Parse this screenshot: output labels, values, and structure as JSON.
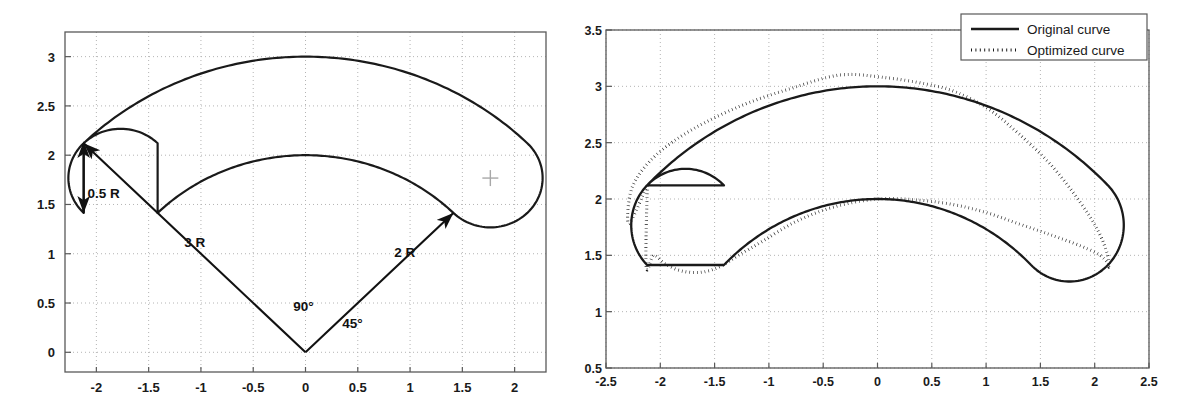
{
  "figure": {
    "background_color": "#ffffff",
    "axis_color": "#595959",
    "grid_color": "#b4b4b4",
    "curve_color": "#1a1a1a",
    "annotation_color": "#111111"
  },
  "chart_data": [
    {
      "id": "left-panel",
      "type": "line",
      "title": "",
      "xlabel": "",
      "ylabel": "",
      "xlim": [
        -2.3,
        2.3
      ],
      "ylim": [
        -0.2,
        3.25
      ],
      "xticks": [
        -2,
        -1.5,
        -1,
        -0.5,
        0,
        0.5,
        1,
        1.5,
        2
      ],
      "xtick_labels": [
        "-2",
        "-1.5",
        "-1",
        "-0.5",
        "0",
        "0.5",
        "1",
        "1.5",
        "2"
      ],
      "yticks": [
        0,
        0.5,
        1,
        1.5,
        2,
        2.5,
        3
      ],
      "ytick_labels": [
        "0",
        "0.5",
        "1",
        "1.5",
        "2",
        "2.5",
        "3"
      ],
      "grid": true,
      "legend": null,
      "geometry": {
        "description": "Closed curvilinear slot: outer arc radius 3, inner arc radius 2, joined by semicircular end caps of radius 0.5, centered on origin, spanning 45deg to 135deg",
        "origin": [
          0,
          0
        ],
        "outer_radius": 3,
        "inner_radius": 2,
        "cap_radius": 0.5,
        "start_angle_deg": 45,
        "end_angle_deg": 135,
        "cap_center_left": [
          -1.7678,
          1.7678
        ],
        "cap_center_right": [
          1.7678,
          1.7678
        ]
      },
      "series": [
        {
          "name": "Original curve",
          "style": "solid",
          "outer_arc_radius": 3,
          "inner_arc_radius": 2
        }
      ],
      "annotations": [
        {
          "id": "radius-3",
          "text": "3 R",
          "x": -1.06,
          "y": 1.07,
          "arrow_from": [
            0,
            0
          ],
          "arrow_to": [
            -2.1213,
            2.1213
          ],
          "arrow_heads": "end"
        },
        {
          "id": "radius-2",
          "text": "2 R",
          "x": 0.95,
          "y": 0.97,
          "arrow_from": [
            0,
            0
          ],
          "arrow_to": [
            1.4142,
            1.4142
          ],
          "arrow_heads": "end"
        },
        {
          "id": "cap-radius",
          "text": "0.5 R",
          "x": -1.93,
          "y": 1.57,
          "arrow_from": [
            -2.1213,
            2.1213
          ],
          "arrow_to": [
            -2.1213,
            1.4142
          ],
          "arrow_heads": "both"
        },
        {
          "id": "angle-90",
          "text": "90°",
          "x": -0.02,
          "y": 0.42
        },
        {
          "id": "angle-45",
          "text": "45°",
          "x": 0.45,
          "y": 0.25
        },
        {
          "id": "center-marker",
          "text": "+",
          "x": 1.7678,
          "y": 1.7678
        }
      ]
    },
    {
      "id": "right-panel",
      "type": "line",
      "title": "",
      "xlabel": "",
      "ylabel": "",
      "xlim": [
        -2.5,
        2.5
      ],
      "ylim": [
        0.5,
        3.5
      ],
      "xticks": [
        -2.5,
        -2,
        -1.5,
        -1,
        -0.5,
        0,
        0.5,
        1,
        1.5,
        2,
        2.5
      ],
      "xtick_labels": [
        "-2.5",
        "-2",
        "-1.5",
        "-1",
        "-0.5",
        "0",
        "0.5",
        "1",
        "1.5",
        "2",
        "2.5"
      ],
      "yticks": [
        0.5,
        1,
        1.5,
        2,
        2.5,
        3,
        3.5
      ],
      "ytick_labels": [
        "0.5",
        "1",
        "1.5",
        "2",
        "2.5",
        "3",
        "3.5"
      ],
      "grid": true,
      "legend": {
        "position": "top-right",
        "entries": [
          {
            "label": "Original curve",
            "style": "solid"
          },
          {
            "label": "Optimized curve",
            "style": "dotted"
          }
        ]
      },
      "series": [
        {
          "name": "Original curve",
          "style": "solid",
          "comment": "same closed slot as left panel: outer R=3, inner R=2, caps R=0.5, 45deg..135deg about (0,0)",
          "outer_radius": 3,
          "inner_radius": 2,
          "cap_radius": 0.5,
          "start_angle_deg": 45,
          "end_angle_deg": 135,
          "key_points": [
            [
              -2.12,
              2.12
            ],
            [
              -2.3,
              1.77
            ],
            [
              -1.77,
              1.27
            ],
            [
              -1.41,
              1.41
            ],
            [
              -0.77,
              1.85
            ],
            [
              0.0,
              2.0
            ],
            [
              0.77,
              1.85
            ],
            [
              1.41,
              1.41
            ],
            [
              1.77,
              1.27
            ],
            [
              2.3,
              1.77
            ],
            [
              2.12,
              2.12
            ],
            [
              1.5,
              2.6
            ],
            [
              0.0,
              3.0
            ],
            [
              -1.5,
              2.6
            ],
            [
              -2.12,
              2.12
            ]
          ]
        },
        {
          "name": "Optimized curve",
          "style": "dotted",
          "comment": "deformed slot: outer boundary bulges up-left to ~3.10 near x=-0.35 and pulls in on the right; inner boundary drops to ~1.35 near x=-1.7 and swings right toward (2.0,1.55)",
          "outer_points": [
            [
              -2.12,
              2.12
            ],
            [
              -2.29,
              1.78
            ],
            [
              -2.26,
              2.1
            ],
            [
              -2.05,
              2.38
            ],
            [
              -1.7,
              2.62
            ],
            [
              -1.25,
              2.83
            ],
            [
              -0.8,
              2.98
            ],
            [
              -0.35,
              3.1
            ],
            [
              0.05,
              3.08
            ],
            [
              0.45,
              3.02
            ],
            [
              0.72,
              2.95
            ],
            [
              1.02,
              2.8
            ],
            [
              1.3,
              2.58
            ],
            [
              1.6,
              2.3
            ],
            [
              1.86,
              1.98
            ],
            [
              2.03,
              1.72
            ],
            [
              2.12,
              1.5
            ],
            [
              2.13,
              1.4
            ]
          ],
          "inner_points": [
            [
              -2.13,
              1.4
            ],
            [
              -2.06,
              1.5
            ],
            [
              -1.95,
              1.42
            ],
            [
              -1.8,
              1.36
            ],
            [
              -1.62,
              1.35
            ],
            [
              -1.45,
              1.4
            ],
            [
              -1.28,
              1.5
            ],
            [
              -1.05,
              1.63
            ],
            [
              -0.75,
              1.8
            ],
            [
              -0.4,
              1.93
            ],
            [
              0.0,
              2.0
            ],
            [
              0.38,
              1.99
            ],
            [
              0.7,
              1.95
            ],
            [
              1.0,
              1.88
            ],
            [
              1.3,
              1.78
            ],
            [
              1.6,
              1.68
            ],
            [
              1.88,
              1.58
            ],
            [
              2.05,
              1.5
            ],
            [
              2.13,
              1.42
            ]
          ]
        }
      ]
    }
  ]
}
